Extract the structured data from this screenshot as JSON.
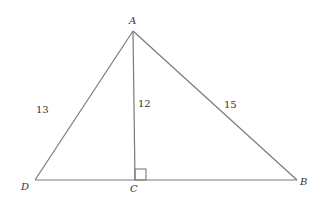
{
  "diagram": {
    "type": "triangle-with-altitude",
    "vertices": {
      "A": {
        "label": "A",
        "x": 133,
        "y": 31
      },
      "D": {
        "label": "D",
        "x": 35,
        "y": 180
      },
      "C": {
        "label": "C",
        "x": 135,
        "y": 180
      },
      "B": {
        "label": "B",
        "x": 297,
        "y": 180
      }
    },
    "segments": [
      {
        "from": "A",
        "to": "D",
        "length_label": "13"
      },
      {
        "from": "A",
        "to": "C",
        "length_label": "12"
      },
      {
        "from": "A",
        "to": "B",
        "length_label": "15"
      },
      {
        "from": "D",
        "to": "B",
        "length_label": ""
      }
    ],
    "right_angle_at": "C",
    "labels": {
      "A": "A",
      "B": "B",
      "C": "C",
      "D": "D",
      "AD": "13",
      "AC": "12",
      "AB": "15"
    },
    "line_color": "#7a7a7a",
    "text_color": "#333333"
  }
}
